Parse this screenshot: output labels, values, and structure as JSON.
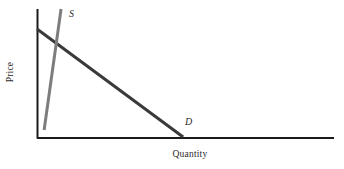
{
  "figure": {
    "background_color": "#ffffff",
    "width": 344,
    "height": 169
  },
  "axes": {
    "y_axis_label": "Price",
    "x_axis_label": "Quantity",
    "axis_color": "#1a1a1a",
    "origin_x": 37,
    "origin_y": 138,
    "x_axis_end_x": 334,
    "y_axis_top_y": 9
  },
  "labels": {
    "supply": "S",
    "demand": "D"
  },
  "chart_data": {
    "type": "line",
    "title": "",
    "subtitle": "",
    "xlabel": "Quantity",
    "ylabel": "Price",
    "grid": false,
    "legend": "inline-curve-labels",
    "axis_ticks": false,
    "xlim": [
      0,
      1
    ],
    "ylim": [
      0,
      1
    ],
    "series": [
      {
        "name": "D",
        "label": "D",
        "role": "demand",
        "color": "#3a3a3a",
        "linewidth": 3,
        "points": [
          {
            "x": 0.0,
            "y": 0.845
          },
          {
            "x": 0.492,
            "y": 0.008
          }
        ],
        "description": "Downward-sloping demand curve from the price axis to the quantity axis"
      },
      {
        "name": "S",
        "label": "S",
        "role": "supply",
        "color": "#7d7d7d",
        "linewidth": 3,
        "points": [
          {
            "x": 0.024,
            "y": 0.062
          },
          {
            "x": 0.081,
            "y": 1.0
          }
        ],
        "description": "Steep upward-sloping supply curve"
      }
    ],
    "annotations": [
      {
        "text": "S",
        "x": 0.118,
        "y": 0.97,
        "style": "italic"
      },
      {
        "text": "D",
        "x": 0.498,
        "y": 0.14,
        "style": "italic"
      }
    ],
    "intersection": {
      "x": 0.064,
      "y": 0.73
    }
  }
}
